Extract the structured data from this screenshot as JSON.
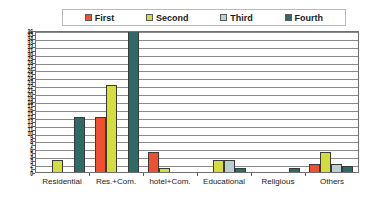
{
  "chart_data": {
    "type": "bar",
    "title": "",
    "xlabel": "",
    "ylabel": "",
    "ylim": [
      0,
      36
    ],
    "ytick_interval": 1,
    "gridline_interval": 2,
    "grid": true,
    "legend_position": "top",
    "categories": [
      "Residential",
      "Res.+Com.",
      "hotel+Com.",
      "Educational",
      "Religious",
      "Others"
    ],
    "series": [
      {
        "name": "First",
        "color": "#ef5130",
        "values": [
          0,
          14,
          5,
          0,
          0,
          2
        ]
      },
      {
        "name": "Second",
        "color": "#d3de3c",
        "values": [
          3,
          22,
          1,
          3,
          0,
          5
        ]
      },
      {
        "name": "Third",
        "color": "#b9cfd4",
        "values": [
          0,
          0,
          0,
          3,
          0,
          2
        ]
      },
      {
        "name": "Fourth",
        "color": "#2e6b66",
        "values": [
          14,
          36,
          0,
          1,
          1,
          1.5
        ]
      }
    ],
    "ytick_labels": [
      "36",
      "35",
      "34",
      "33",
      "32",
      "31",
      "30",
      "29",
      "28",
      "27",
      "26",
      "25",
      "24",
      "23",
      "22",
      "21",
      "20",
      "19",
      "18",
      "17",
      "16",
      "15",
      "14",
      "13",
      "12",
      "11",
      "10",
      "9",
      "8",
      "7",
      "6",
      "5",
      "4",
      "3",
      "2",
      "1",
      "0"
    ]
  },
  "legend": {
    "entries": [
      {
        "label": "First"
      },
      {
        "label": "Second"
      },
      {
        "label": "Third"
      },
      {
        "label": "Fourth"
      }
    ]
  },
  "colors": {
    "first": "#ef5130",
    "second": "#d3de3c",
    "third": "#b9cfd4",
    "fourth": "#2e6b66",
    "gridline": "#8a8a8a",
    "frame": "#6f6f6f",
    "background": "#ffffff",
    "text": "#1b1b1b"
  }
}
